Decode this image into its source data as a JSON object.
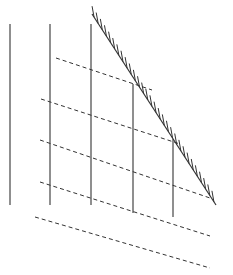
{
  "diagram": {
    "width": 233,
    "height": 275,
    "background": "#ffffff",
    "stroke_color": "#333333",
    "solid_vertical_lines": [
      {
        "x": 10,
        "y1": 24,
        "y2": 205
      },
      {
        "x": 50,
        "y1": 24,
        "y2": 205
      },
      {
        "x": 91,
        "y1": 24,
        "y2": 205
      },
      {
        "x": 133,
        "y1": 84,
        "y2": 213
      },
      {
        "x": 173,
        "y1": 139,
        "y2": 217
      }
    ],
    "dashed_lines": [
      {
        "x1": 56,
        "y1": 58,
        "x2": 152,
        "y2": 90
      },
      {
        "x1": 41,
        "y1": 99,
        "x2": 180,
        "y2": 144
      },
      {
        "x1": 40,
        "y1": 140,
        "x2": 210,
        "y2": 198
      },
      {
        "x1": 40,
        "y1": 182,
        "x2": 210,
        "y2": 236
      },
      {
        "x1": 35,
        "y1": 217,
        "x2": 210,
        "y2": 268
      }
    ],
    "hatched_boundary": {
      "x1": 92,
      "y1": 14,
      "x2": 216,
      "y2": 205,
      "tick_count": 30,
      "tick_length": 11,
      "tick_side": "upper-right"
    }
  }
}
